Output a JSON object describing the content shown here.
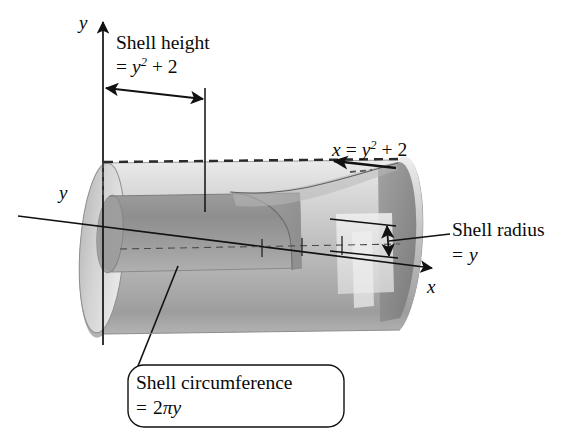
{
  "figure": {
    "background_color": "#ffffff",
    "ink_color": "#111111"
  },
  "axes": {
    "y_top_label": "y",
    "y_mid_label": "y",
    "x_label": "x",
    "y_axis_name": "y-axis",
    "x_axis_name": "x-axis"
  },
  "annotations": {
    "shell_height": {
      "line1": "Shell height",
      "line2_prefix": "=",
      "line2_var": "y",
      "line2_exponent": "2",
      "line2_suffix": "+ 2",
      "full": "Shell height = y2 + 2"
    },
    "curve_equation": {
      "lhs": "x",
      "eq": "=",
      "var": "y",
      "exponent": "2",
      "suffix": "+ 2",
      "full": "x = y2 + 2"
    },
    "shell_radius": {
      "line1": "Shell radius",
      "line2_prefix": "=",
      "line2_var": "y",
      "full": "Shell radius = y"
    },
    "shell_circumference": {
      "line1": "Shell circumference",
      "line2_prefix": "=",
      "line2_coeff": "2",
      "line2_pi": "π",
      "line2_var": "y",
      "full": "Shell circumference = 2πy"
    }
  },
  "geometry": {
    "cylinder": {
      "description": "outer cylinder with elliptical caps, axis tilted slightly downward to the right",
      "outer_fill_light": "#e3e3e3",
      "outer_fill_mid": "#c3c3c3",
      "outer_fill_dark": "#9a9a9a",
      "inner_band_fill": "#a9a9a9",
      "inner_band_dark": "#8b8b8b",
      "cut_face_fill": "#b4b4b4"
    },
    "dashed_top_edge": true,
    "axis_tick_count": 3
  }
}
